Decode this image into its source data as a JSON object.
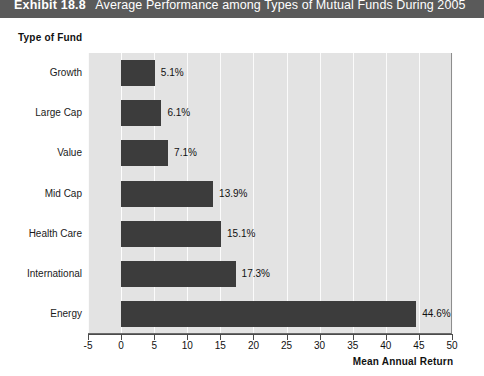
{
  "exhibit": {
    "number": "Exhibit 18.8",
    "title": "Average Performance among Types of Mutual Funds During 2005"
  },
  "chart_data": {
    "type": "bar",
    "orientation": "horizontal",
    "title": "Average Performance among Types of Mutual Funds During 2005",
    "xlabel": "Mean Annual Return",
    "ylabel": "Type of Fund",
    "categories": [
      "Growth",
      "Large Cap",
      "Value",
      "Mid Cap",
      "Health Care",
      "International",
      "Energy"
    ],
    "values": [
      5.1,
      6.1,
      7.1,
      13.9,
      15.1,
      17.3,
      44.6
    ],
    "value_labels": [
      "5.1%",
      "6.1%",
      "7.1%",
      "13.9%",
      "15.1%",
      "17.3%",
      "44.6%"
    ],
    "xlim": [
      -5,
      50
    ],
    "xticks": [
      -5,
      0,
      5,
      10,
      15,
      20,
      25,
      30,
      35,
      40,
      45,
      50
    ],
    "xtick_labels": [
      "-5",
      "0",
      "5",
      "10",
      "15",
      "20",
      "25",
      "30",
      "35",
      "40",
      "45",
      "50"
    ],
    "grid": true,
    "grid_axis": "x",
    "legend": false,
    "bar_color": "#3c3c3c",
    "plot_background": "#e3e3e3",
    "gridline_color": "#fbfbfb"
  }
}
